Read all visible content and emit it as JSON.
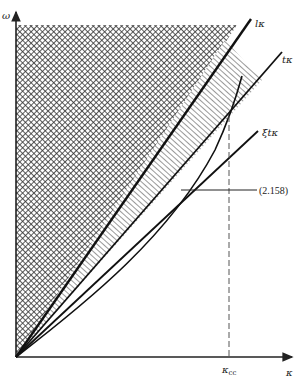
{
  "diagram": {
    "type": "dispersion-region-plot",
    "axes": {
      "y_label": "ω",
      "x_label": "κ",
      "x_marker_label": "κ",
      "x_marker_subscript": "cc"
    },
    "lines": [
      {
        "id": "l-kappa",
        "label": "lκ"
      },
      {
        "id": "t-kappa",
        "label": "tκ"
      },
      {
        "id": "xi-t-kappa",
        "label": "ξtκ"
      }
    ],
    "curve": {
      "id": "eq-2-158",
      "label": "(2.158)"
    },
    "regions": [
      {
        "id": "cross-hatched",
        "pattern": "crosshatch",
        "bounded_by": [
          "ω-axis",
          "top",
          "lκ"
        ]
      },
      {
        "id": "line-hatched",
        "pattern": "diagonal-lines",
        "bounded_by": [
          "lκ",
          "tκ"
        ]
      }
    ],
    "colors": {
      "ink": "#222222",
      "dashed": "#555555",
      "background": "#ffffff"
    }
  }
}
